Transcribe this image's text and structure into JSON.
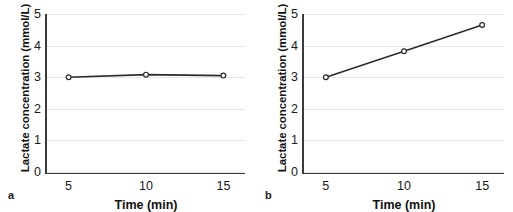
{
  "figure": {
    "background_color": "#ffffff",
    "axis_color": "#3a3a3a",
    "grid_color": "#e6e6e6",
    "line_color": "#2b2b2b",
    "marker_fill": "#ffffff"
  },
  "panels": [
    {
      "tag": "a",
      "ylabel": "Lactate concentration (mmol/L)",
      "xlabel": "Time (min)",
      "yticks": [
        "0",
        "1",
        "2",
        "3",
        "4",
        "5"
      ],
      "xticks": [
        "5",
        "10",
        "15"
      ]
    },
    {
      "tag": "b",
      "ylabel": "Lactate concentration (mmol/L)",
      "xlabel": "Time (min)",
      "yticks": [
        "0",
        "1",
        "2",
        "3",
        "4",
        "5"
      ],
      "xticks": [
        "5",
        "10",
        "15"
      ]
    }
  ],
  "chart_data": [
    {
      "type": "line",
      "title": "",
      "panel": "a",
      "xlabel": "Time (min)",
      "ylabel": "Lactate concentration (mmol/L)",
      "x": [
        5,
        10,
        15
      ],
      "values": [
        3.0,
        3.08,
        3.05
      ],
      "xlim": [
        3.6,
        16.4
      ],
      "ylim": [
        0,
        5
      ],
      "xticks": [
        5,
        10,
        15
      ],
      "yticks": [
        0,
        1,
        2,
        3,
        4,
        5
      ],
      "grid": true,
      "legend": "none",
      "markers": "open-circle"
    },
    {
      "type": "line",
      "title": "",
      "panel": "b",
      "xlabel": "Time (min)",
      "ylabel": "Lactate concentration (mmol/L)",
      "x": [
        5,
        10,
        15
      ],
      "values": [
        3.0,
        3.82,
        4.65
      ],
      "xlim": [
        3.6,
        16.4
      ],
      "ylim": [
        0,
        5
      ],
      "xticks": [
        5,
        10,
        15
      ],
      "yticks": [
        0,
        1,
        2,
        3,
        4,
        5
      ],
      "grid": true,
      "legend": "none",
      "markers": "open-circle"
    }
  ]
}
